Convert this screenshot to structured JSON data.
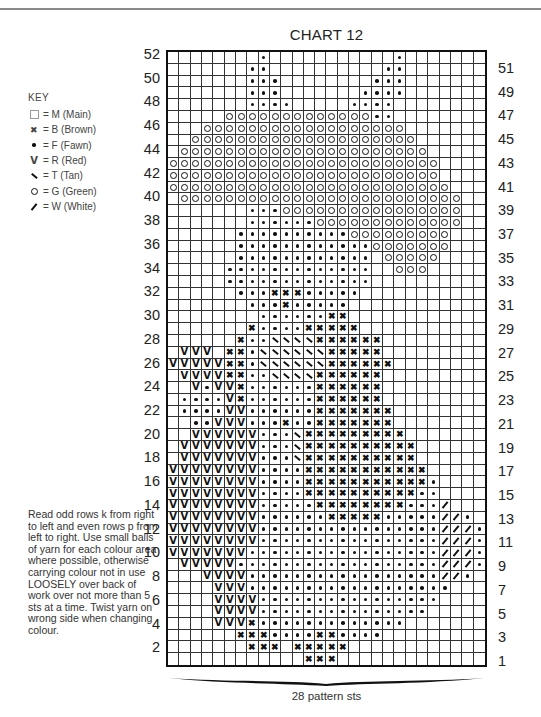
{
  "title": "CHART 12",
  "key": {
    "heading": "KEY",
    "items": [
      {
        "symbol": "blank-square",
        "code": "M",
        "label": "= M (Main)"
      },
      {
        "symbol": "cross",
        "code": "B",
        "label": "= B (Brown)"
      },
      {
        "symbol": "dot",
        "code": "F",
        "label": "= F (Fawn)"
      },
      {
        "symbol": "v",
        "code": "R",
        "label": "= R (Red)"
      },
      {
        "symbol": "backslash",
        "code": "T",
        "label": "= T (Tan)"
      },
      {
        "symbol": "circle",
        "code": "G",
        "label": "= G (Green)"
      },
      {
        "symbol": "slash",
        "code": "W",
        "label": "= W (White)"
      }
    ]
  },
  "instructions": "Read odd rows k from right to left and even rows p from left to right. Use small balls of yarn for each colour area where possible, otherwise carrying colour not in use LOOSELY over back of work over not more than 5 sts at a time. Twist yarn on wrong side when changing colour.",
  "footer": {
    "stitch_count_label": "28 pattern sts"
  },
  "row_labels": {
    "left_even": [
      "52",
      "50",
      "48",
      "46",
      "44",
      "42",
      "40",
      "38",
      "36",
      "34",
      "32",
      "30",
      "28",
      "26",
      "24",
      "22",
      "20",
      "18",
      "16",
      "14",
      "12",
      "10",
      "8",
      "6",
      "4",
      "2"
    ],
    "right_odd": [
      "51",
      "49",
      "47",
      "45",
      "43",
      "41",
      "39",
      "37",
      "35",
      "33",
      "31",
      "29",
      "27",
      "25",
      "23",
      "21",
      "19",
      "17",
      "15",
      "13",
      "11",
      "9",
      "7",
      "5",
      "3",
      "1"
    ]
  },
  "chart_data": {
    "type": "table",
    "title": "CHART 12",
    "columns": 28,
    "rows": 52,
    "legend": {
      ".": "M (Main)",
      "x": "B (Brown)",
      "f": "F (Fawn)",
      "v": "R (Red)",
      "t": "T (Tan)",
      "o": "G (Green)",
      "w": "W (White)"
    },
    "grid_top_to_bottom_row52_to_row1": [
      "........f...........f.......",
      ".......ff..........ff.......",
      ".......fff........fff.......",
      ".......fff.......ffff.......",
      ".......ffff.....ffff........",
      ".....oooooooooooooff........",
      "...oooooooooooooooooo.......",
      "..oooooooooooooooooooo......",
      ".oooooooooooooooooooooo.....",
      "oooooooooooooooooooooooo....",
      "oooooooooooooooooooooooo....",
      "ooooooooooooooooooooooooo...",
      ".ooooooooooooooooooooooooo..",
      ".......fffoooooooooooooooo..",
      ".......ffffffooooooooooooo..",
      "......ffffffffffooooooooo...",
      "......ffffffffffffooooooo...",
      "......ffffffffffff.ooooo....",
      ".....fffffffffffff..ooo.....",
      ".....fffffffffffff..........",
      "......fffxxxfffff...........",
      ".......fffxfffff............",
      "........ffffffxx............",
      ".......xffffxxxxx...........",
      "......xffttttxxxxxx.........",
      ".vvv.xxfttttttxxxxx.........",
      "vvvvvxxfttttttxxxxxx........",
      ".vvvvxxffttttxxxxxx.........",
      "..vfvvxffffffxxxxxx.........",
      ".ffffvxffffffxxxxxx.........",
      ".ffffvvffffffxxxxxxx........",
      "..ffvvvfffxffxxxxxxx........",
      "..vvvvvvffftxxxxxxxxx.......",
      ".vvvvvvvffftxxxxxxxxxx......",
      ".vvvvvvvffftxxxxxxxxxx......",
      "vvvvvvvvffffxxxxxxxxxxx.....",
      "vvvvvvvvffffxxxxxxxxxxxf....",
      "vvvvvvvvffffxxxxxxxxxxff....",
      "vvvvvvvvfffffxxxxxxxxfffw...",
      "vvvvvvvvffffffxxxxxfffffwwf.",
      "vvvvvvvvffffffffffffffffwwwf",
      "vvvvvvvvffffffffffffffffwwwf",
      "vvvvvvvfffffffffffffffffwwwf",
      ".vvvvvffffffffffffffffffwwwf",
      "...vvvvfffffffffffffffffwwf.",
      "....vvvffffffffffffffffff...",
      "....vvvvffffffffffffffff....",
      "....vvvvfffffffffffffff.....",
      "....vvvxfffffffffffff.......",
      "......xxxffffxxffff.........",
      ".......xxx.xxxxx............",
      "............xxx............."
    ],
    "xlabel": "28 pattern sts"
  }
}
